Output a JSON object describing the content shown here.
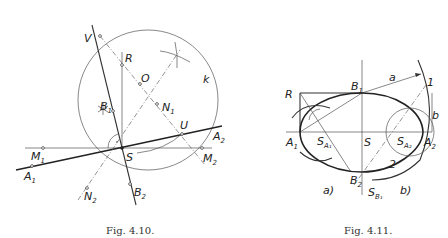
{
  "figures": [
    {
      "caption": "Fig. 4.10.",
      "labels": {
        "V": "V",
        "R": "R",
        "O": "O",
        "k": "k",
        "B1": "B",
        "B1_sub": "1",
        "N1": "N",
        "N1_sub": "1",
        "U": "U",
        "A2": "A",
        "A2_sub": "2",
        "M1": "M",
        "M1_sub": "1",
        "S": "S",
        "M2": "M",
        "M2_sub": "2",
        "A1": "A",
        "A1_sub": "1",
        "N2": "N",
        "N2_sub": "2",
        "B2": "B",
        "B2_sub": "2"
      }
    },
    {
      "caption": "Fig. 4.11.",
      "labels": {
        "R": "R",
        "B1": "B",
        "B1_sub": "1",
        "a": "a",
        "one": "1",
        "b": "b",
        "A1": "A",
        "A1_sub": "1",
        "SA1": "S",
        "SA1_sub": "A₁",
        "S": "S",
        "SA2": "S",
        "SA2_sub": "A₂",
        "A2": "A",
        "A2_sub": "2",
        "two": "2",
        "B2": "B",
        "B2_sub": "2",
        "SB1": "S",
        "SB1_sub": "B₁",
        "part_a": "a)",
        "part_b": "b)"
      }
    }
  ]
}
